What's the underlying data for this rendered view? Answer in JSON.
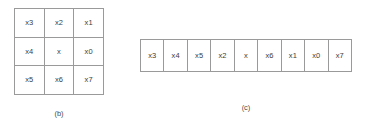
{
  "figure": {
    "background_color": "#ffffff",
    "line_color": "#9a9a9a",
    "text_color": "#3d3d3d",
    "panels": [
      {
        "id": "b",
        "caption": "(b)",
        "type": "grid",
        "rows": 3,
        "cols": 3,
        "cells": [
          [
            "x3",
            "x2",
            "x1"
          ],
          [
            "x4",
            "x",
            "x0"
          ],
          [
            "x5",
            "x6",
            "x7"
          ]
        ]
      },
      {
        "id": "c",
        "caption": "(c)",
        "type": "strip",
        "rows": 1,
        "cols": 9,
        "cells": [
          "x3",
          "x4",
          "x5",
          "x2",
          "x",
          "x6",
          "x1",
          "x0",
          "x7"
        ]
      }
    ]
  },
  "panel_b": {
    "caption": "(b)",
    "r0c0": "x3",
    "r0c1": "x2",
    "r0c2": "x1",
    "r1c0": "x4",
    "r1c1": "x",
    "r1c2": "x0",
    "r2c0": "x5",
    "r2c1": "x6",
    "r2c2": "x7"
  },
  "panel_c": {
    "caption": "(c)",
    "c0": "x3",
    "c1": "x4",
    "c2": "x5",
    "c3": "x2",
    "c4": "x",
    "c5": "x6",
    "c6": "x1",
    "c7": "x0",
    "c8": "x7"
  }
}
